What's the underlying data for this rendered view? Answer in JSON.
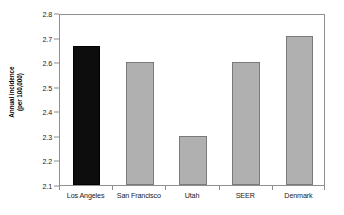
{
  "chart_data": {
    "type": "bar",
    "title": "",
    "subtitle": "",
    "xlabel": "",
    "ylabel": "Annual incidence (per 100,000)",
    "ylabel_line1": "Annual incidence",
    "ylabel_line2": "(per 100,000)",
    "categories": [
      "Los Angeles",
      "San Francisco",
      "Utah",
      "SEER",
      "Denmark"
    ],
    "values": [
      2.665,
      2.6,
      2.3,
      2.6,
      2.705
    ],
    "value_labels": [
      "2.665",
      "2.60",
      "2.30",
      "2.60",
      "2.705"
    ],
    "bar_colors": [
      "#0d0d0d",
      "#b0b0b0",
      "#b0b0b0",
      "#b0b0b0",
      "#b0b0b0"
    ],
    "bar_border_colors": [
      "#000000",
      "#7a7a7a",
      "#7a7a7a",
      "#7a7a7a",
      "#7a7a7a"
    ],
    "highlighted_category": "Los Angeles",
    "ylim": [
      2.1,
      2.8
    ],
    "ytick_values": [
      2.1,
      2.2,
      2.3,
      2.4,
      2.5,
      2.6,
      2.7,
      2.8
    ],
    "ytick_labels": [
      "2.1",
      "2.2",
      "2.3",
      "2.4",
      "2.5",
      "2.6",
      "2.7",
      "2.8"
    ],
    "grid": false,
    "legend": false,
    "legend_position": "none",
    "frame_color": "#8f8f8f",
    "background_color": "#ffffff",
    "text_color": "#1a1a1a"
  }
}
